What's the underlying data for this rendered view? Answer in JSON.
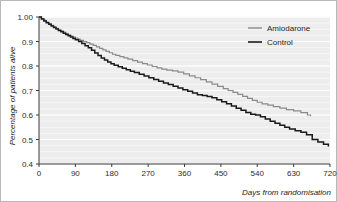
{
  "chart_data": {
    "type": "line",
    "title": "",
    "subtitle": "",
    "xlabel": "Days from randomisation",
    "ylabel": "Percentage of patients alive",
    "xlim": [
      0,
      720
    ],
    "ylim": [
      0.4,
      1.0
    ],
    "xticks": [
      0,
      90,
      180,
      270,
      360,
      450,
      540,
      630,
      720
    ],
    "xtick_labels": [
      "0",
      "90",
      "180",
      "270",
      "360",
      "450",
      "540",
      "630",
      "720"
    ],
    "yticks": [
      0.4,
      0.5,
      0.6,
      0.7,
      0.8,
      0.9,
      1.0
    ],
    "ytick_labels": [
      "0.4",
      "0.5",
      "0.6",
      "0.7",
      "0.8",
      "0.9",
      "1.00"
    ],
    "grid": "horizontal-minor",
    "legend_position": "top-right",
    "plot_background": "#ededed",
    "series": [
      {
        "name": "Amiodarone",
        "color": "#8a8a8a",
        "step": "post",
        "x": [
          0,
          6,
          12,
          18,
          24,
          30,
          36,
          42,
          48,
          54,
          60,
          66,
          72,
          78,
          84,
          90,
          96,
          102,
          110,
          118,
          126,
          134,
          142,
          150,
          158,
          166,
          174,
          182,
          190,
          200,
          210,
          220,
          232,
          244,
          256,
          268,
          280,
          292,
          304,
          316,
          330,
          344,
          358,
          372,
          386,
          400,
          414,
          428,
          442,
          456,
          468,
          480,
          492,
          504,
          516,
          528,
          540,
          552,
          566,
          580,
          596,
          612,
          630,
          648,
          664,
          672
        ],
        "y": [
          1.0,
          0.993,
          0.986,
          0.979,
          0.972,
          0.966,
          0.96,
          0.954,
          0.948,
          0.943,
          0.938,
          0.932,
          0.927,
          0.922,
          0.918,
          0.914,
          0.91,
          0.905,
          0.9,
          0.895,
          0.889,
          0.884,
          0.878,
          0.872,
          0.866,
          0.86,
          0.854,
          0.848,
          0.843,
          0.838,
          0.833,
          0.828,
          0.822,
          0.816,
          0.81,
          0.804,
          0.798,
          0.792,
          0.787,
          0.783,
          0.78,
          0.775,
          0.768,
          0.76,
          0.752,
          0.744,
          0.735,
          0.726,
          0.717,
          0.708,
          0.7,
          0.692,
          0.684,
          0.676,
          0.668,
          0.66,
          0.652,
          0.645,
          0.64,
          0.634,
          0.628,
          0.622,
          0.617,
          0.61,
          0.6,
          0.595
        ]
      },
      {
        "name": "Control",
        "color": "#1a1a1a",
        "step": "post",
        "x": [
          0,
          6,
          12,
          18,
          24,
          30,
          36,
          42,
          48,
          54,
          60,
          66,
          72,
          78,
          84,
          90,
          98,
          106,
          114,
          122,
          130,
          138,
          146,
          154,
          162,
          170,
          178,
          186,
          196,
          206,
          216,
          226,
          236,
          248,
          260,
          272,
          284,
          296,
          308,
          320,
          332,
          344,
          356,
          368,
          380,
          392,
          404,
          416,
          428,
          440,
          452,
          464,
          476,
          488,
          500,
          512,
          524,
          536,
          548,
          560,
          572,
          584,
          596,
          608,
          620,
          634,
          648,
          662,
          676,
          690,
          704,
          716
        ],
        "y": [
          1.0,
          0.992,
          0.984,
          0.977,
          0.97,
          0.963,
          0.957,
          0.951,
          0.945,
          0.94,
          0.934,
          0.929,
          0.923,
          0.918,
          0.912,
          0.907,
          0.9,
          0.892,
          0.883,
          0.874,
          0.864,
          0.853,
          0.843,
          0.833,
          0.824,
          0.816,
          0.809,
          0.803,
          0.797,
          0.791,
          0.785,
          0.779,
          0.773,
          0.766,
          0.759,
          0.752,
          0.745,
          0.738,
          0.731,
          0.724,
          0.717,
          0.71,
          0.703,
          0.697,
          0.69,
          0.683,
          0.68,
          0.676,
          0.67,
          0.662,
          0.654,
          0.646,
          0.637,
          0.628,
          0.619,
          0.61,
          0.603,
          0.6,
          0.593,
          0.584,
          0.575,
          0.566,
          0.558,
          0.55,
          0.543,
          0.536,
          0.53,
          0.519,
          0.5,
          0.49,
          0.481,
          0.471
        ]
      }
    ]
  },
  "legend": {
    "items": [
      {
        "label": "Amiodarone",
        "color": "#8a8a8a"
      },
      {
        "label": "Control",
        "color": "#1a1a1a"
      }
    ]
  }
}
